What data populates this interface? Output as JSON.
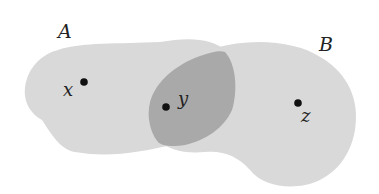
{
  "diagram": {
    "type": "venn-like overlapping sets",
    "colors": {
      "background": "#ffffff",
      "set_fill": "#d9d9d9",
      "intersection_fill": "#a9a9a9",
      "point": "#111111",
      "label": "#222222"
    },
    "sets": [
      {
        "id": "A",
        "label": "A"
      },
      {
        "id": "B",
        "label": "B"
      }
    ],
    "intersection": {
      "label": "A ∩ B"
    },
    "points": [
      {
        "id": "x",
        "label": "x",
        "region": "A only"
      },
      {
        "id": "y",
        "label": "y",
        "region": "A ∩ B"
      },
      {
        "id": "z",
        "label": "z",
        "region": "B only"
      }
    ]
  }
}
